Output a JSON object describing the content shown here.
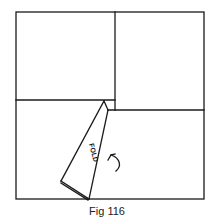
{
  "figure": {
    "caption": "Fig 116",
    "fold_label": "FOLD",
    "stroke_color": "#1a1a1a",
    "background": "#ffffff",
    "frame": {
      "x1": 16,
      "y1": 12,
      "x2": 204,
      "y2": 199
    },
    "vertical_divider_x": 115,
    "left_horizontal_y": 100,
    "right_horizontal_y": 110,
    "fold_triangle": {
      "top": [
        104,
        101
      ],
      "top_right": [
        108,
        110
      ],
      "left": [
        61,
        181
      ],
      "bottom": [
        89,
        199
      ]
    },
    "arrow_icon": "curved-arrow-counterclockwise"
  }
}
